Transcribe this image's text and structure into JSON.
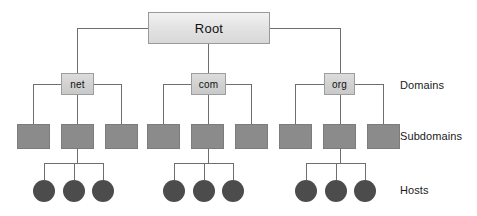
{
  "diagram": {
    "colors": {
      "root_fill_light": "#f2f2f2",
      "root_fill_dark": "#d8d8d8",
      "domain_fill": "#d2d2d2",
      "subdomain_fill": "#8b8b8b",
      "host_fill": "#4c4c4c",
      "line": "#6e6e6e",
      "text": "#111111",
      "background": "#ffffff"
    },
    "root": {
      "label": "Root",
      "x": 148,
      "y": 12,
      "w": 122,
      "h": 32
    },
    "tier_labels": [
      {
        "label": "Domains",
        "x": 400,
        "y": 80
      },
      {
        "label": "Subdomains",
        "x": 400,
        "y": 131
      },
      {
        "label": "Hosts",
        "x": 400,
        "y": 184
      }
    ],
    "domains": [
      {
        "label": "net",
        "x": 61,
        "y": 73,
        "w": 33,
        "h": 22
      },
      {
        "label": "com",
        "x": 191,
        "y": 73,
        "w": 35,
        "h": 22
      },
      {
        "label": "org",
        "x": 324,
        "y": 73,
        "w": 31,
        "h": 22
      }
    ],
    "subdomains": [
      {
        "x": 17,
        "y": 124,
        "w": 33,
        "h": 25
      },
      {
        "x": 61,
        "y": 124,
        "w": 33,
        "h": 25
      },
      {
        "x": 105,
        "y": 124,
        "w": 33,
        "h": 25
      },
      {
        "x": 147,
        "y": 124,
        "w": 33,
        "h": 25
      },
      {
        "x": 191,
        "y": 124,
        "w": 33,
        "h": 25
      },
      {
        "x": 235,
        "y": 124,
        "w": 33,
        "h": 25
      },
      {
        "x": 279,
        "y": 124,
        "w": 33,
        "h": 25
      },
      {
        "x": 323,
        "y": 124,
        "w": 33,
        "h": 25
      },
      {
        "x": 367,
        "y": 124,
        "w": 33,
        "h": 25
      }
    ],
    "hosts": [
      {
        "cx": 44,
        "cy": 191,
        "r": 11
      },
      {
        "cx": 74,
        "cy": 191,
        "r": 11
      },
      {
        "cx": 103,
        "cy": 191,
        "r": 11
      },
      {
        "cx": 174,
        "cy": 191,
        "r": 11
      },
      {
        "cx": 204,
        "cy": 191,
        "r": 11
      },
      {
        "cx": 233,
        "cy": 191,
        "r": 11
      },
      {
        "cx": 306,
        "cy": 191,
        "r": 11
      },
      {
        "cx": 336,
        "cy": 191,
        "r": 11
      },
      {
        "cx": 365,
        "cy": 191,
        "r": 11
      }
    ],
    "edges": {
      "root_to_domains": {
        "bus_y": 28,
        "left_from_x": 148,
        "left_to_x": 77,
        "right_from_x": 270,
        "right_to_x": 340,
        "center_x": 208,
        "drop_top_y": 44,
        "drop_bottom_y": 73
      },
      "domain_buses": [
        {
          "y": 84,
          "x1": 33,
          "x2": 122,
          "stub_x": [
            33,
            77,
            122
          ]
        },
        {
          "y": 84,
          "x1": 163,
          "x2": 252,
          "stub_x": [
            163,
            208,
            252
          ]
        },
        {
          "y": 84,
          "x1": 295,
          "x2": 384,
          "stub_x": [
            295,
            340,
            384
          ]
        }
      ],
      "host_buses": [
        {
          "y": 163,
          "x1": 44,
          "x2": 103,
          "stub_x": [
            44,
            74,
            103
          ],
          "parent_x": 77
        },
        {
          "y": 163,
          "x1": 174,
          "x2": 233,
          "stub_x": [
            174,
            204,
            233
          ],
          "parent_x": 208
        },
        {
          "y": 163,
          "x1": 306,
          "x2": 365,
          "stub_x": [
            306,
            336,
            365
          ],
          "parent_x": 340
        }
      ]
    }
  }
}
